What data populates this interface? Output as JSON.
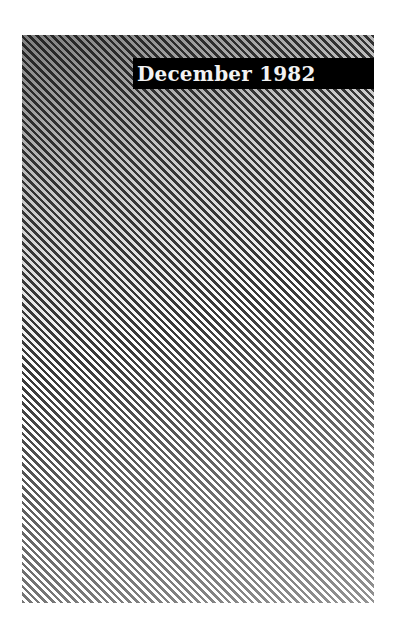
{
  "cover": {
    "title": "December 1982",
    "colors": {
      "background": "#ffffff",
      "stripe": "#3a3a3a",
      "title_bar": "#000000",
      "title_text": "#f2f2f2"
    },
    "pattern": "diagonal-stripes-gradient"
  }
}
